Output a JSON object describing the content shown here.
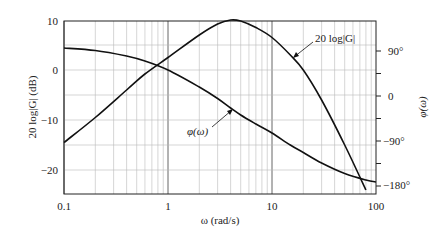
{
  "chart_data": {
    "type": "line",
    "title": "",
    "xlabel": "ω (rad/s)",
    "ylabel": "20 log|G| (dB)",
    "y2label": "φ(ω)",
    "xscale": "log",
    "xlim": [
      0.1,
      100
    ],
    "ylim": [
      -25,
      10
    ],
    "y2lim": [
      -190,
      100
    ],
    "grid": true,
    "x_ticks": [
      "0.1",
      "1",
      "10",
      "100"
    ],
    "y_ticks": [
      "10",
      "0",
      "−10",
      "−20"
    ],
    "y2_ticks": [
      "90°",
      "0",
      "−90°",
      "−180°"
    ],
    "series": [
      {
        "name": "20 log|G|",
        "axis": "left",
        "x": [
          0.1,
          0.2,
          0.4,
          0.6,
          1,
          2,
          3,
          4,
          5,
          7,
          10,
          15,
          20,
          30,
          50,
          80
        ],
        "values": [
          -14.5,
          -9.5,
          -4,
          -0.8,
          2.5,
          7,
          9.2,
          10,
          9.8,
          8.5,
          6.5,
          3,
          0,
          -6,
          -15,
          -24
        ]
      },
      {
        "name": "φ(ω)",
        "axis": "right",
        "x": [
          0.1,
          0.2,
          0.4,
          0.6,
          1,
          2,
          3,
          4,
          5,
          7,
          10,
          15,
          20,
          30,
          50,
          80,
          100
        ],
        "values": [
          96,
          91,
          80,
          70,
          52,
          18,
          -5,
          -24,
          -38,
          -56,
          -74,
          -98,
          -113,
          -134,
          -155,
          -168,
          -172
        ]
      }
    ],
    "annotations": [
      {
        "text": "20 log|G|",
        "target_series": "20 log|G|"
      },
      {
        "text": "φ(ω)",
        "target_series": "φ(ω)"
      }
    ]
  },
  "labels": {
    "xlabel": "ω (rad/s)",
    "ylabel": "20 log|G| (dB)",
    "y2label": "φ(ω)",
    "mag_annotation": "20 log|G|",
    "phase_annotation": "φ(ω)"
  },
  "ticks": {
    "x": [
      "0.1",
      "1",
      "10",
      "100"
    ],
    "y": [
      "10",
      "0",
      "−10",
      "−20"
    ],
    "y2": [
      "90°",
      "0",
      "−90°",
      "−180°"
    ]
  }
}
